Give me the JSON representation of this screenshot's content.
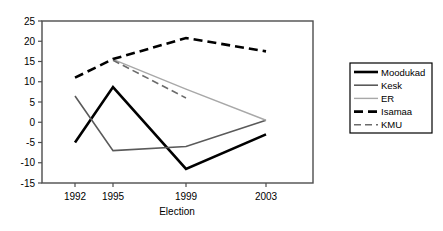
{
  "chart_data": {
    "type": "line",
    "title": "",
    "xlabel": "Election",
    "ylabel": "",
    "categories": [
      "1992",
      "1995",
      "1999",
      "2003"
    ],
    "x": [
      1992,
      1995,
      1999,
      2003
    ],
    "ylim": [
      -15,
      25
    ],
    "yticks": [
      25,
      20,
      15,
      10,
      5,
      0,
      -5,
      -10,
      -15
    ],
    "ytick_labels": [
      "25",
      "20",
      "15",
      "10",
      "5",
      "0",
      "-5",
      "-10",
      "-15"
    ],
    "grid": false,
    "legend_position": "right",
    "series": [
      {
        "name": "Moodukad",
        "values": [
          -5,
          8.7,
          -11.5,
          -3
        ],
        "style": "solid",
        "color": "#000000",
        "width": 2.6
      },
      {
        "name": "Kesk",
        "values": [
          6.5,
          -7,
          -6,
          0.5
        ],
        "style": "solid",
        "color": "#5a5a5a",
        "width": 1.6
      },
      {
        "name": "ER",
        "values": [
          null,
          15.5,
          8.2,
          0.5
        ],
        "style": "solid",
        "color": "#a8a8a8",
        "width": 1.4
      },
      {
        "name": "Isamaa",
        "values": [
          11,
          15.6,
          20.8,
          17.5
        ],
        "style": "dashed",
        "color": "#000000",
        "width": 2.6
      },
      {
        "name": "KMU",
        "values": [
          null,
          15.3,
          6.0,
          null
        ],
        "style": "dashed",
        "color": "#6b6b6b",
        "width": 1.6
      }
    ]
  },
  "axis": {
    "x_tick_labels": [
      "1992",
      "1995",
      "1999",
      "2003"
    ],
    "y_tick_labels": [
      "25",
      "20",
      "15",
      "10",
      "5",
      "0",
      "-5",
      "-10",
      "-15"
    ],
    "x_title": "Election"
  },
  "legend": {
    "items": [
      {
        "label": "Moodukad"
      },
      {
        "label": "Kesk"
      },
      {
        "label": "ER"
      },
      {
        "label": "Isamaa"
      },
      {
        "label": "KMU"
      }
    ]
  },
  "colors": {
    "plot_border": "#4d4d4d",
    "background": "#ffffff",
    "text": "#000000"
  }
}
